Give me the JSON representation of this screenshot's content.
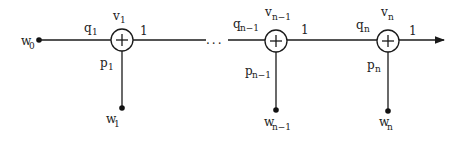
{
  "diagram": {
    "type": "signal-flow-graph",
    "source": {
      "label": "w",
      "subscript": "0"
    },
    "ellipsis": "...",
    "nodes": [
      {
        "id": "node-1",
        "v": {
          "label": "v",
          "subscript": "1"
        },
        "q": {
          "label": "q",
          "subscript": "1"
        },
        "p": {
          "label": "p",
          "subscript": "1"
        },
        "w": {
          "label": "w",
          "subscript": "1"
        },
        "out_gain": "1",
        "symbol": "+"
      },
      {
        "id": "node-n-1",
        "v": {
          "label": "v",
          "subscript": "n−1"
        },
        "q": {
          "label": "q",
          "subscript": "n−1"
        },
        "p": {
          "label": "p",
          "subscript": "n−1"
        },
        "w": {
          "label": "w",
          "subscript": "n−1"
        },
        "out_gain": "1",
        "symbol": "+"
      },
      {
        "id": "node-n",
        "v": {
          "label": "v",
          "subscript": "n"
        },
        "q": {
          "label": "q",
          "subscript": "n"
        },
        "p": {
          "label": "p",
          "subscript": "n"
        },
        "w": {
          "label": "w",
          "subscript": "n"
        },
        "out_gain": "1",
        "symbol": "+"
      }
    ],
    "colors": {
      "stroke": "#1a1a1a",
      "background": "#ffffff"
    }
  }
}
